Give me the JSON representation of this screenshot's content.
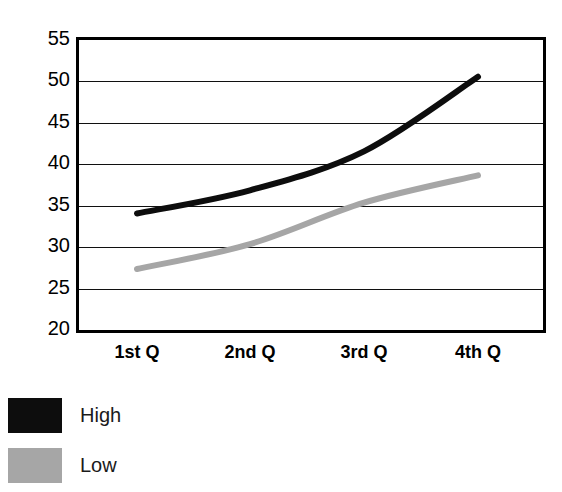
{
  "chart_data": {
    "type": "line",
    "title": "",
    "subtitle": "",
    "xlabel": "",
    "ylabel": "",
    "categories": [
      "1st Q",
      "2nd Q",
      "3rd Q",
      "4th Q"
    ],
    "series": [
      {
        "name": "High",
        "values": [
          33.7,
          36.5,
          41.2,
          50.2
        ],
        "color": "#0d0d0d"
      },
      {
        "name": "Low",
        "values": [
          27.0,
          30.0,
          35.0,
          38.3
        ],
        "color": "#a6a6a6"
      }
    ],
    "ylim": [
      20,
      55
    ],
    "yticks": [
      20,
      25,
      30,
      35,
      40,
      45,
      50,
      55
    ],
    "ytick_labels": [
      "20",
      "25",
      "30",
      "35",
      "40",
      "45",
      "50",
      "55"
    ],
    "grid": true,
    "grid_axis": "y",
    "legend_position": "bottom-left",
    "legend_entries": [
      {
        "label": "High",
        "color": "#0d0d0d"
      },
      {
        "label": "Low",
        "color": "#a6a6a6"
      }
    ],
    "frame_color": "#000000",
    "background": "#ffffff"
  }
}
